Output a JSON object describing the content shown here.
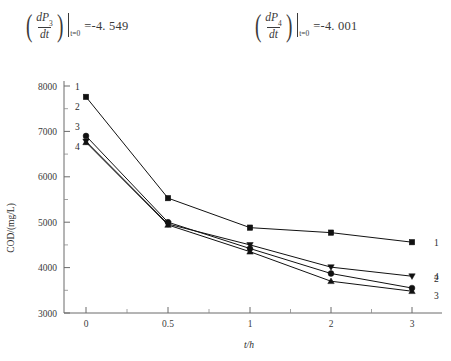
{
  "annotations": {
    "formula_left": {
      "numerator": "dP",
      "numerator_sub": "3",
      "denominator": "dt",
      "eval_at": "t=0",
      "equals_value": "=-4. 549"
    },
    "formula_right": {
      "numerator": "dP",
      "numerator_sub": "4",
      "denominator": "dt",
      "eval_at": "t=0",
      "equals_value": "=-4. 001"
    }
  },
  "chart_data": {
    "type": "line",
    "title": "",
    "xlabel": "t/h",
    "ylabel": "COD/(mg/L)",
    "x": [
      0,
      0.5,
      1,
      2,
      3
    ],
    "xtick_labels": [
      "0",
      "0.5",
      "1",
      "2",
      "3"
    ],
    "ytick_labels": [
      "3000",
      "4000",
      "5000",
      "6000",
      "7000",
      "8000"
    ],
    "ytick_values": [
      3000,
      4000,
      5000,
      6000,
      7000,
      8000
    ],
    "ylim": [
      3000,
      8000
    ],
    "grid": false,
    "legend_position": "inline-endpoints",
    "minor_ticks": true,
    "series": [
      {
        "name": "1",
        "marker": "square",
        "left_label": "1",
        "right_label": "1",
        "values": [
          7760,
          5530,
          4880,
          4770,
          4560
        ]
      },
      {
        "name": "2",
        "marker": "triangle-down",
        "left_label": "2",
        "right_label": "2",
        "values": [
          6780,
          4960,
          4500,
          4010,
          3810
        ]
      },
      {
        "name": "3",
        "marker": "triangle-up",
        "left_label": "3",
        "right_label": "3",
        "values": [
          6760,
          4940,
          4350,
          3700,
          3480
        ]
      },
      {
        "name": "4",
        "marker": "circle",
        "left_label": "4",
        "right_label": "4",
        "values": [
          6900,
          5000,
          4420,
          3870,
          3550
        ]
      }
    ]
  }
}
